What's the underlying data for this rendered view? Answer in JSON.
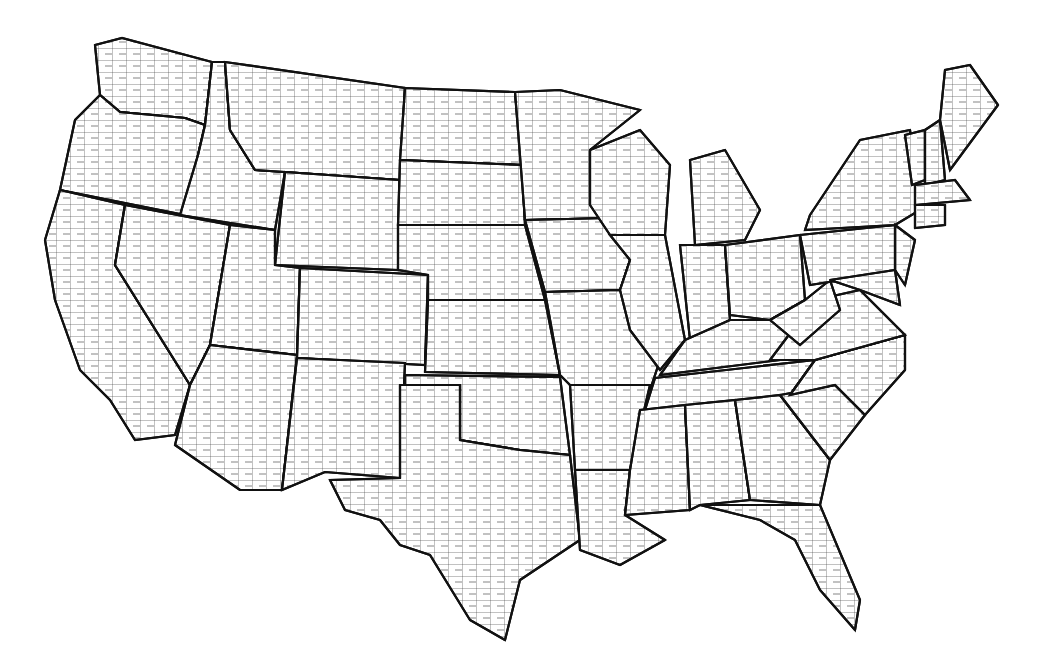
{
  "map": {
    "title": "",
    "subject": "United States counties outline map",
    "colors": {
      "background": "#ffffff",
      "state_border": "#111111",
      "county_border": "#333333"
    },
    "states": [
      {
        "id": "WA",
        "d": "M95,45 L122,38 L212,62 L205,125 L185,118 L120,112 L100,95 Z"
      },
      {
        "id": "OR",
        "d": "M100,95 L120,112 L185,118 L205,125 L198,155 L185,215 L60,190 L75,120 Z"
      },
      {
        "id": "CA",
        "d": "M60,190 L125,205 L115,265 L190,385 L175,435 L135,440 L110,400 L80,370 L55,300 L45,240 Z"
      },
      {
        "id": "ID",
        "d": "M212,62 L225,62 L230,130 L255,170 L285,172 L275,230 L180,215 L198,155 L205,125 Z"
      },
      {
        "id": "NV",
        "d": "M125,205 L230,225 L210,345 L190,385 L115,265 Z"
      },
      {
        "id": "MT",
        "d": "M225,62 L405,88 L400,180 L285,172 L255,170 L230,130 Z"
      },
      {
        "id": "WY",
        "d": "M285,172 L400,180 L398,270 L275,265 Z"
      },
      {
        "id": "UT",
        "d": "M230,225 L275,230 L275,265 L300,268 L297,355 L210,345 Z"
      },
      {
        "id": "AZ",
        "d": "M210,345 L297,355 L282,490 L240,490 L175,445 L190,385 Z"
      },
      {
        "id": "CO",
        "d": "M300,268 L428,275 L425,365 L297,358 Z"
      },
      {
        "id": "NM",
        "d": "M297,358 L405,363 L400,478 L325,472 L282,490 Z"
      },
      {
        "id": "ND",
        "d": "M405,88 L515,92 L522,165 L400,160 Z"
      },
      {
        "id": "SD",
        "d": "M400,160 L522,165 L525,225 L398,225 Z"
      },
      {
        "id": "NE",
        "d": "M398,225 L525,225 L545,300 L428,300 L428,275 L398,270 Z"
      },
      {
        "id": "KS",
        "d": "M428,300 L545,300 L560,375 L425,372 Z"
      },
      {
        "id": "OK",
        "d": "M405,375 L560,377 L570,455 L520,450 L460,440 L460,385 L405,385 Z"
      },
      {
        "id": "TX",
        "d": "M400,385 L460,385 L460,440 L520,450 L570,455 L580,540 L520,580 L505,640 L470,620 L430,555 L400,545 L380,520 L345,510 L330,480 L400,478 Z"
      },
      {
        "id": "MN",
        "d": "M515,92 L560,90 L640,110 L590,150 L590,205 L610,218 L525,220 Z"
      },
      {
        "id": "IA",
        "d": "M525,220 L610,218 L630,260 L620,290 L545,292 Z"
      },
      {
        "id": "MO",
        "d": "M545,292 L620,290 L660,360 L650,390 L570,385 L560,375 Z"
      },
      {
        "id": "AR",
        "d": "M570,385 L650,385 L630,470 L575,470 Z"
      },
      {
        "id": "LA",
        "d": "M575,470 L630,470 L625,515 L665,540 L620,565 L580,550 Z"
      },
      {
        "id": "WI",
        "d": "M590,150 L640,130 L670,165 L665,235 L610,235 L590,205 Z"
      },
      {
        "id": "IL",
        "d": "M610,235 L665,235 L685,340 L660,370 L630,330 L620,290 L630,260 Z"
      },
      {
        "id": "MI",
        "d": "M690,160 L725,150 L760,210 L745,240 L695,245 Z"
      },
      {
        "id": "IN",
        "d": "M680,245 L725,245 L730,320 L690,340 Z"
      },
      {
        "id": "OH",
        "d": "M725,245 L800,235 L805,300 L770,320 L730,315 Z"
      },
      {
        "id": "KY",
        "d": "M685,340 L730,320 L770,320 L800,330 L780,360 L660,375 Z"
      },
      {
        "id": "TN",
        "d": "M655,378 L815,360 L790,395 L645,410 Z"
      },
      {
        "id": "MS",
        "d": "M640,410 L685,405 L690,510 L625,515 L630,470 Z"
      },
      {
        "id": "AL",
        "d": "M685,405 L735,400 L750,500 L700,505 L690,510 Z"
      },
      {
        "id": "GA",
        "d": "M735,400 L780,395 L830,460 L820,505 L750,500 Z"
      },
      {
        "id": "FL",
        "d": "M700,505 L820,505 L860,600 L855,630 L820,590 L795,540 L760,520 Z"
      },
      {
        "id": "SC",
        "d": "M780,395 L835,385 L865,415 L830,460 Z"
      },
      {
        "id": "NC",
        "d": "M790,395 L815,360 L905,335 L905,370 L865,415 L835,385 Z"
      },
      {
        "id": "VA",
        "d": "M770,360 L815,300 L860,290 L905,335 L815,360 Z"
      },
      {
        "id": "WV",
        "d": "M770,320 L805,300 L830,280 L840,310 L800,345 Z"
      },
      {
        "id": "PA",
        "d": "M800,235 L895,225 L905,270 L810,285 Z"
      },
      {
        "id": "NY",
        "d": "M810,215 L860,140 L910,130 L920,210 L895,225 L805,230 Z"
      },
      {
        "id": "NJ",
        "d": "M895,225 L915,240 L905,285 L895,270 Z"
      },
      {
        "id": "MD",
        "d": "M830,280 L895,270 L900,305 L860,290 Z"
      },
      {
        "id": "VT",
        "d": "M905,135 L925,130 L925,180 L912,185 Z"
      },
      {
        "id": "NH",
        "d": "M925,130 L940,120 L945,180 L925,185 Z"
      },
      {
        "id": "ME",
        "d": "M940,120 L945,70 L970,65 L998,105 L950,170 Z"
      },
      {
        "id": "MA",
        "d": "M915,185 L955,180 L970,200 L915,205 Z"
      },
      {
        "id": "CT",
        "d": "M915,205 L945,205 L945,225 L915,228 Z"
      }
    ]
  }
}
